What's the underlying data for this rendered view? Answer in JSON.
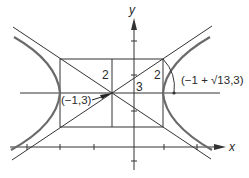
{
  "figure": {
    "type": "hyperbola-diagram",
    "axes": {
      "x_label": "x",
      "y_label": "y"
    },
    "labels": {
      "center_point": "(−1,3)",
      "vertex_point": "(−1 + √13,3)",
      "semi_minor_left": "2",
      "semi_major": "3",
      "semi_minor_right": "2"
    },
    "center": [
      -1,
      3
    ],
    "a": 3,
    "b": 2,
    "c": "√13",
    "colors": {
      "curve": "#6a6a6a",
      "lines": "#333333",
      "background": "#ffffff"
    }
  }
}
